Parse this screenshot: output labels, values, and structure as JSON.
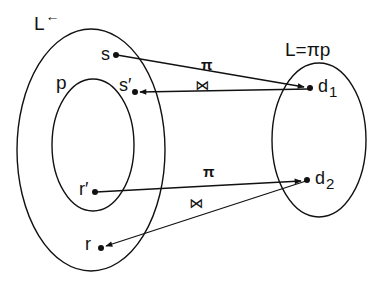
{
  "diagram": {
    "sets": {
      "outer": {
        "label": "L",
        "label_marker": "←"
      },
      "inner": {
        "label": "p"
      },
      "right": {
        "label": "L=πp"
      }
    },
    "points": {
      "s": "s",
      "s_prime": "s′",
      "r_prime": "r′",
      "r": "r",
      "d1": {
        "base": "d",
        "sub": "1"
      },
      "d2": {
        "base": "d",
        "sub": "2"
      }
    },
    "edges": [
      {
        "from": "s",
        "to": "d1",
        "label": "π"
      },
      {
        "from": "d1",
        "to": "s′",
        "label": "⋈"
      },
      {
        "from": "r′",
        "to": "d2",
        "label": "π"
      },
      {
        "from": "d2",
        "to": "r",
        "label": "⋈"
      }
    ],
    "colors": {
      "stroke": "#111111",
      "background": "#ffffff"
    }
  }
}
